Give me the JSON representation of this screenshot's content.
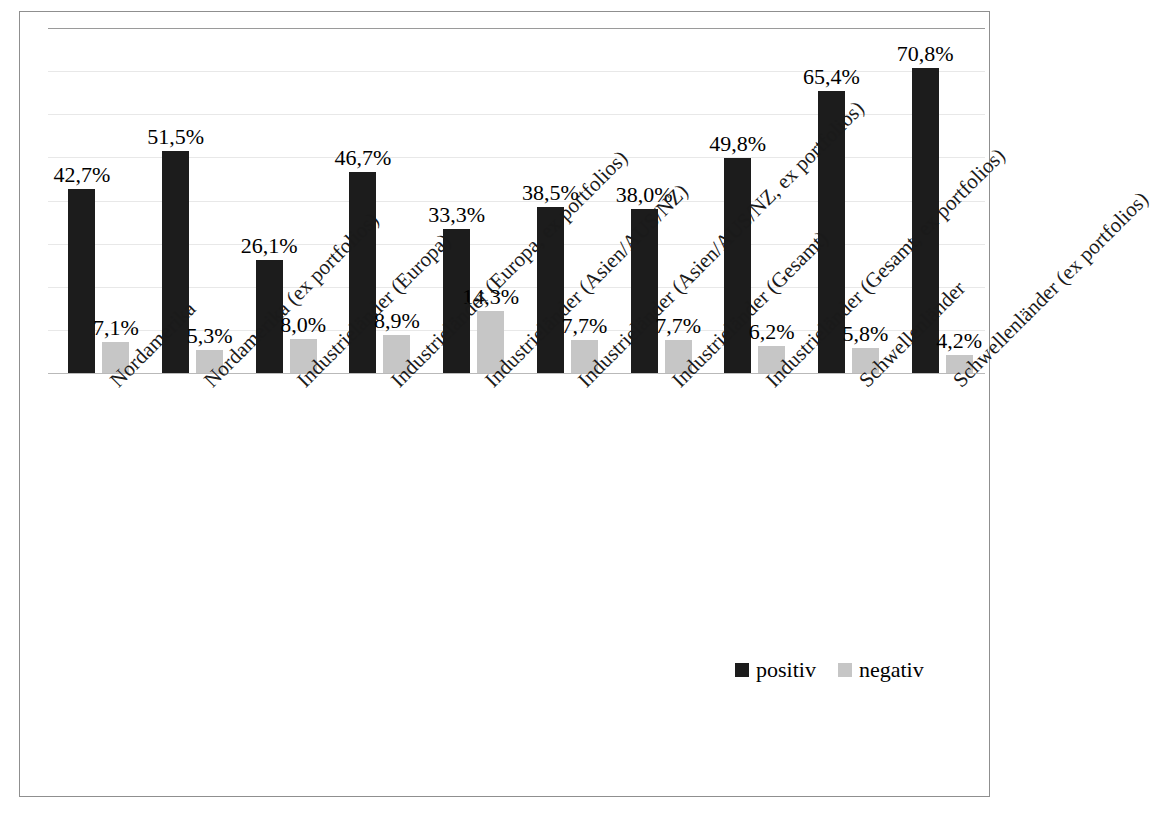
{
  "chart_data": {
    "type": "bar",
    "title": "",
    "subtitle": "",
    "xlabel": "",
    "ylabel": "",
    "ylim": [
      0,
      80
    ],
    "ytick_labels": [
      "80%",
      "70%",
      "60%",
      "50%",
      "40%",
      "30%",
      "20%",
      "10%",
      "0%"
    ],
    "ytick_values": [
      80,
      70,
      60,
      50,
      40,
      30,
      20,
      10,
      0
    ],
    "grid": true,
    "legend_position": "bottom-right",
    "categories": [
      "Nordamerika",
      "Nordamerika (ex portfolios)",
      "Industrieländer (Europa)",
      "Industrieländer (Europa, ex portfolios)",
      "Industrieländer (Asien/AUS/NZ)",
      "Industrieländer (Asien/AUS/NZ, ex portfolios)",
      "Industrieländer (Gesamt)",
      "Industrieländer (Gesamt, ex portfolios)",
      "Schwellenländer",
      "Schwellenländer (ex portfolios)"
    ],
    "series": [
      {
        "name": "positiv",
        "color": "#1c1c1c",
        "values": [
          42.7,
          51.5,
          26.1,
          46.7,
          33.3,
          38.5,
          38.0,
          49.8,
          65.4,
          70.8
        ],
        "labels": [
          "42,7%",
          "51,5%",
          "26,1%",
          "46,7%",
          "33,3%",
          "38,5%",
          "38,0%",
          "49,8%",
          "65,4%",
          "70,8%"
        ]
      },
      {
        "name": "negativ",
        "color": "#c6c6c6",
        "values": [
          7.1,
          5.3,
          8.0,
          8.9,
          14.3,
          7.7,
          7.7,
          6.2,
          5.8,
          4.2
        ],
        "labels": [
          "7,1%",
          "5,3%",
          "8,0%",
          "8,9%",
          "14,3%",
          "7,7%",
          "7,7%",
          "6,2%",
          "5,8%",
          "4,2%"
        ]
      }
    ]
  },
  "legend": {
    "items": [
      {
        "label": "positiv",
        "color": "#1c1c1c"
      },
      {
        "label": "negativ",
        "color": "#c6c6c6"
      }
    ]
  }
}
